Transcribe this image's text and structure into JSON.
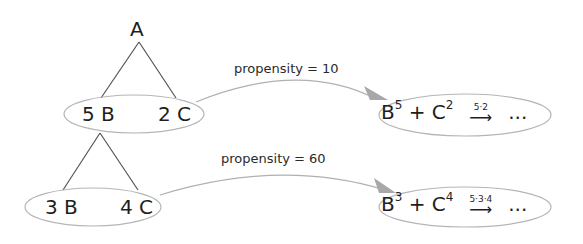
{
  "diagram": {
    "root": {
      "label": "A"
    },
    "level1": {
      "left": "5 B",
      "right": "2 C"
    },
    "level2": {
      "left": "3 B",
      "right": "4 C"
    },
    "edges": [
      {
        "label": "propensity = 10",
        "from": "level1",
        "to": "result1"
      },
      {
        "label": "propensity = 60",
        "from": "level2",
        "to": "result2"
      }
    ],
    "result1": {
      "base1": "B",
      "exp1": "5",
      "plus": "+",
      "base2": "C",
      "exp2": "2",
      "rate": "5·2",
      "arrow": "⟶",
      "ellipsis": "..."
    },
    "result2": {
      "base1": "B",
      "exp1": "3",
      "plus": "+",
      "base2": "C",
      "exp2": "4",
      "rate": "5·3·4",
      "arrow": "⟶",
      "ellipsis": "..."
    }
  },
  "colors": {
    "line": "#555555",
    "ellipse": "#b5b5b5",
    "arrow": "#a8a8a8",
    "text": "#1e1e1e"
  }
}
